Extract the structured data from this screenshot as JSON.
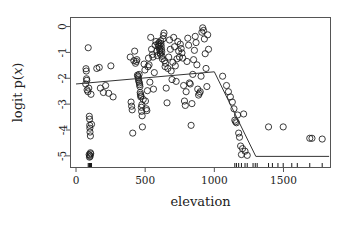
{
  "figure": {
    "background": "#ffffff",
    "frame_color": "#555555",
    "point_color": "#1a1a1a",
    "line_color": "#333333"
  },
  "chart_data": {
    "type": "scatter",
    "title": "",
    "subtitle": "",
    "xlabel": "elevation",
    "ylabel": "logit p(x)",
    "ylabel_parts": {
      "prefix": "logit ",
      "p": "p",
      "open": "(",
      "var": "x",
      "close": ")"
    },
    "xlim": [
      -40,
      1840
    ],
    "ylim": [
      -5.45,
      0.35
    ],
    "xticks": [
      0,
      500,
      1000,
      1500
    ],
    "xtick_labels": [
      "0",
      "500",
      "1000",
      "1500"
    ],
    "yticks": [
      0,
      -1,
      -2,
      -3,
      -4,
      -5
    ],
    "ytick_labels": [
      "0",
      "-1",
      "-2",
      "-3",
      "-4",
      "-5"
    ],
    "grid": false,
    "legend": null,
    "marker": "open-circle",
    "marker_size": 3.1,
    "series": [
      {
        "name": "observations",
        "type": "scatter",
        "points": [
          [
            88,
            -0.82
          ],
          [
            96,
            -3.47
          ],
          [
            98,
            -3.58
          ],
          [
            99,
            -3.82
          ],
          [
            100,
            -3.93
          ],
          [
            101,
            -4.08
          ],
          [
            104,
            -4.23
          ],
          [
            112,
            -3.78
          ],
          [
            95,
            -4.95
          ],
          [
            99,
            -4.98
          ],
          [
            102,
            -5.02
          ],
          [
            104,
            -4.88
          ],
          [
            97,
            -5.05
          ],
          [
            106,
            -4.92
          ],
          [
            72,
            -1.63
          ],
          [
            74,
            -1.72
          ],
          [
            76,
            -2.02
          ],
          [
            78,
            -2.08
          ],
          [
            70,
            -2.22
          ],
          [
            80,
            -2.45
          ],
          [
            86,
            -2.52
          ],
          [
            92,
            -2.38
          ],
          [
            108,
            -2.62
          ],
          [
            150,
            -1.62
          ],
          [
            168,
            -1.58
          ],
          [
            176,
            -2.38
          ],
          [
            198,
            -2.55
          ],
          [
            214,
            -2.28
          ],
          [
            236,
            -2.58
          ],
          [
            252,
            -1.52
          ],
          [
            268,
            -2.72
          ],
          [
            392,
            -1.18
          ],
          [
            398,
            -2.92
          ],
          [
            402,
            -3.08
          ],
          [
            406,
            -3.22
          ],
          [
            410,
            -4.12
          ],
          [
            418,
            -1.32
          ],
          [
            424,
            -0.95
          ],
          [
            430,
            -1.42
          ],
          [
            436,
            -1.35
          ],
          [
            440,
            -1.28
          ],
          [
            444,
            -1.88
          ],
          [
            448,
            -1.92
          ],
          [
            450,
            -1.98
          ],
          [
            452,
            -2.05
          ],
          [
            454,
            -2.12
          ],
          [
            456,
            -1.85
          ],
          [
            458,
            -2.18
          ],
          [
            460,
            -2.25
          ],
          [
            462,
            -2.32
          ],
          [
            464,
            -2.55
          ],
          [
            466,
            -2.62
          ],
          [
            468,
            -2.72
          ],
          [
            470,
            -2.68
          ],
          [
            472,
            -3.12
          ],
          [
            474,
            -3.28
          ],
          [
            476,
            -3.02
          ],
          [
            478,
            -3.45
          ],
          [
            480,
            -3.88
          ],
          [
            486,
            -2.82
          ],
          [
            492,
            -1.45
          ],
          [
            498,
            -1.68
          ],
          [
            502,
            -2.88
          ],
          [
            508,
            -3.18
          ],
          [
            512,
            -3.25
          ],
          [
            516,
            -2.48
          ],
          [
            520,
            -1.55
          ],
          [
            524,
            -1.22
          ],
          [
            528,
            -1.48
          ],
          [
            534,
            -2.15
          ],
          [
            540,
            -0.42
          ],
          [
            546,
            -0.88
          ],
          [
            552,
            -1.08
          ],
          [
            556,
            -1.18
          ],
          [
            560,
            -2.42
          ],
          [
            566,
            -1.78
          ],
          [
            572,
            -0.72
          ],
          [
            578,
            -0.58
          ],
          [
            584,
            -0.95
          ],
          [
            588,
            -1.12
          ],
          [
            592,
            -0.68
          ],
          [
            596,
            -0.78
          ],
          [
            600,
            -0.62
          ],
          [
            602,
            -0.72
          ],
          [
            604,
            -0.85
          ],
          [
            606,
            -0.92
          ],
          [
            608,
            -1.02
          ],
          [
            610,
            -1.08
          ],
          [
            612,
            -0.55
          ],
          [
            614,
            -0.65
          ],
          [
            616,
            -0.75
          ],
          [
            618,
            -0.88
          ],
          [
            620,
            -0.98
          ],
          [
            622,
            -1.15
          ],
          [
            624,
            -1.25
          ],
          [
            628,
            -0.48
          ],
          [
            632,
            -0.35
          ],
          [
            636,
            -0.25
          ],
          [
            640,
            -1.32
          ],
          [
            644,
            -1.55
          ],
          [
            648,
            -1.42
          ],
          [
            652,
            -2.38
          ],
          [
            658,
            -2.95
          ],
          [
            664,
            -1.62
          ],
          [
            670,
            -1.18
          ],
          [
            676,
            -0.52
          ],
          [
            682,
            -0.88
          ],
          [
            688,
            -1.72
          ],
          [
            694,
            -2.05
          ],
          [
            700,
            -1.38
          ],
          [
            706,
            -0.42
          ],
          [
            712,
            -0.78
          ],
          [
            718,
            -1.52
          ],
          [
            724,
            -2.12
          ],
          [
            730,
            -1.25
          ],
          [
            736,
            -0.58
          ],
          [
            742,
            -0.95
          ],
          [
            748,
            -1.18
          ],
          [
            754,
            -0.68
          ],
          [
            760,
            -0.85
          ],
          [
            766,
            -1.02
          ],
          [
            772,
            -1.22
          ],
          [
            778,
            -2.28
          ],
          [
            784,
            -2.88
          ],
          [
            790,
            -3.05
          ],
          [
            796,
            -2.52
          ],
          [
            802,
            -1.35
          ],
          [
            808,
            -0.45
          ],
          [
            814,
            -0.72
          ],
          [
            820,
            -2.18
          ],
          [
            826,
            -2.22
          ],
          [
            832,
            -3.82
          ],
          [
            838,
            -2.98
          ],
          [
            844,
            -1.85
          ],
          [
            850,
            -1.28
          ],
          [
            856,
            -0.92
          ],
          [
            862,
            -0.38
          ],
          [
            868,
            -0.62
          ],
          [
            874,
            -1.48
          ],
          [
            880,
            -2.42
          ],
          [
            886,
            -2.65
          ],
          [
            892,
            -2.58
          ],
          [
            898,
            -2.52
          ],
          [
            904,
            -1.92
          ],
          [
            910,
            -0.22
          ],
          [
            916,
            -0.05
          ],
          [
            922,
            -0.15
          ],
          [
            928,
            -0.48
          ],
          [
            934,
            -1.05
          ],
          [
            940,
            -1.62
          ],
          [
            946,
            -2.32
          ],
          [
            952,
            -0.32
          ],
          [
            958,
            -0.88
          ],
          [
            1060,
            -1.92
          ],
          [
            1088,
            -2.28
          ],
          [
            1102,
            -2.52
          ],
          [
            1116,
            -2.72
          ],
          [
            1130,
            -2.92
          ],
          [
            1142,
            -3.18
          ],
          [
            1148,
            -3.62
          ],
          [
            1154,
            -3.68
          ],
          [
            1160,
            -3.72
          ],
          [
            1168,
            -3.42
          ],
          [
            1176,
            -4.12
          ],
          [
            1182,
            -4.28
          ],
          [
            1190,
            -4.62
          ],
          [
            1196,
            -4.95
          ],
          [
            1204,
            -4.72
          ],
          [
            1212,
            -3.38
          ],
          [
            1222,
            -4.82
          ],
          [
            1238,
            -4.98
          ],
          [
            1392,
            -3.88
          ],
          [
            1498,
            -3.88
          ],
          [
            1690,
            -4.32
          ],
          [
            1706,
            -4.32
          ],
          [
            1780,
            -4.35
          ]
        ]
      },
      {
        "name": "fitted-spline",
        "type": "line",
        "points": [
          [
            0,
            -2.22
          ],
          [
            1000,
            -1.75
          ],
          [
            1300,
            -5.02
          ],
          [
            1830,
            -5.02
          ]
        ]
      }
    ],
    "rug": {
      "axis": "x",
      "values": [
        88,
        95,
        96,
        97,
        98,
        99,
        100,
        101,
        102,
        104,
        106,
        108,
        112,
        1148,
        1160,
        1176,
        1196,
        1222,
        1238,
        1280,
        1296,
        1310,
        1392,
        1420,
        1460,
        1498,
        1560,
        1600,
        1690,
        1780
      ]
    }
  }
}
